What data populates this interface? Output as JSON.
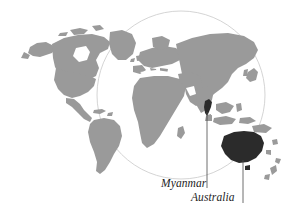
{
  "figure": {
    "type": "world-map-locator",
    "background_color": "#ffffff"
  },
  "map": {
    "land_color": "#9a9a9a",
    "highlight_color": "#2b2b2b",
    "circle_color": "#c9c9c9",
    "leader_line_color": "#4a4a4a",
    "projection_circle": {
      "center_x": 181,
      "center_y": 95,
      "radius": 84
    }
  },
  "labels": {
    "myanmar": {
      "text": "Myanmar",
      "x": 161,
      "y": 177
    },
    "australia": {
      "text": "Australia",
      "x": 191,
      "y": 191
    }
  },
  "highlighted_regions": [
    {
      "name": "Myanmar",
      "color": "#2b2b2b"
    },
    {
      "name": "Australia",
      "color": "#2b2b2b"
    }
  ],
  "leader_lines": [
    {
      "name": "myanmar-leader-line",
      "x": 207,
      "y_top": 112,
      "y_bottom": 188
    },
    {
      "name": "australia-leader-line",
      "x": 243,
      "y_top": 160,
      "y_bottom": 203
    }
  ]
}
